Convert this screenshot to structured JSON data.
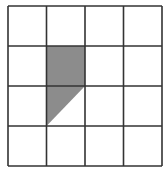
{
  "diagram": {
    "type": "grid",
    "rows": 4,
    "cols": 4,
    "x_lines": [
      8,
      46.5,
      85,
      123.5,
      162
    ],
    "y_lines": [
      6,
      46,
      86,
      126,
      166
    ],
    "line_color": "#333333",
    "fill_color": "#8c8c8c",
    "shaded_regions": [
      {
        "shape": "square",
        "row": 1,
        "col": 1
      },
      {
        "shape": "triangle",
        "row": 2,
        "col": 1,
        "vertices": [
          "top-left",
          "top-right",
          "bottom-left"
        ]
      }
    ]
  }
}
